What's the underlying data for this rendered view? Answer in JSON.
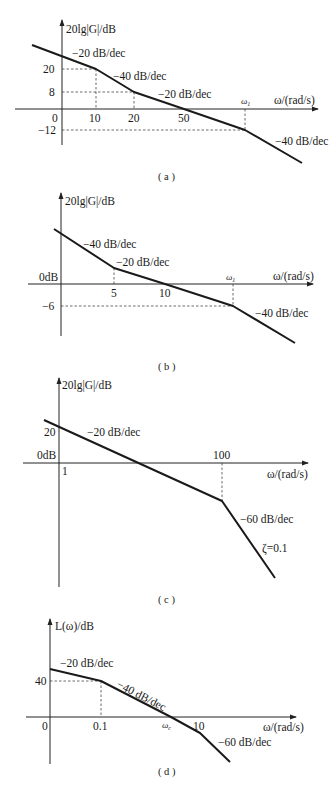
{
  "chart_data": [
    {
      "id": "a",
      "type": "line",
      "title": "Bode asymptotic magnitude plot (a)",
      "caption": "( a )",
      "ylabel": "20lg|G|/dB",
      "xlabel": "ω/(rad/s)",
      "x_scale": "log",
      "y_ticks": [
        "20",
        "8",
        "0",
        "-12"
      ],
      "x_ticks": [
        "10",
        "20",
        "50",
        "ω1"
      ],
      "breakpoints": [
        {
          "omega": "10",
          "db": 20
        },
        {
          "omega": "20",
          "db": 8
        },
        {
          "omega": "50",
          "db": 0
        },
        {
          "omega": "ω1",
          "db": -12
        }
      ],
      "slopes": [
        "-20 dB/dec",
        "-40 dB/dec",
        "-20 dB/dec",
        "-40 dB/dec"
      ],
      "px": {
        "origin": [
          62,
          109
        ],
        "yaxis_top": 20,
        "yaxis_bottom": 145,
        "xaxis_left": 15,
        "xaxis_right": 318,
        "curve": [
          [
            32,
            45
          ],
          [
            96,
            69
          ],
          [
            134,
            92
          ],
          [
            184,
            109
          ],
          [
            245,
            130
          ],
          [
            302,
            163
          ]
        ],
        "guides": [
          {
            "x1": 62,
            "y1": 69,
            "x2": 96,
            "y2": 69
          },
          {
            "x1": 96,
            "y1": 69,
            "x2": 96,
            "y2": 109
          },
          {
            "x1": 62,
            "y1": 92,
            "x2": 134,
            "y2": 92
          },
          {
            "x1": 134,
            "y1": 92,
            "x2": 134,
            "y2": 109
          },
          {
            "x1": 62,
            "y1": 130,
            "x2": 245,
            "y2": 130
          },
          {
            "x1": 245,
            "y1": 109,
            "x2": 245,
            "y2": 130
          }
        ]
      }
    },
    {
      "id": "b",
      "type": "line",
      "title": "Bode asymptotic magnitude plot (b)",
      "caption": "( b )",
      "ylabel": "20lg|G|/dB",
      "xlabel": "ω/(rad/s)",
      "x_scale": "log",
      "y_ticks": [
        "0dB",
        "-6"
      ],
      "x_ticks": [
        "5",
        "10",
        "ω1"
      ],
      "breakpoints": [
        {
          "omega": "5",
          "db": null
        },
        {
          "omega": "10",
          "db": 0
        },
        {
          "omega": "ω1",
          "db": -6
        }
      ],
      "slopes": [
        "-40 dB/dec",
        "-20 dB/dec",
        "-40 dB/dec"
      ],
      "px": {
        "origin": [
          61,
          284
        ],
        "yaxis_top": 193,
        "yaxis_bottom": 336,
        "xaxis_left": 28,
        "xaxis_right": 313,
        "curve": [
          [
            54,
            229
          ],
          [
            114,
            268
          ],
          [
            165,
            284
          ],
          [
            233,
            306
          ],
          [
            295,
            343
          ]
        ],
        "guides": [
          {
            "x1": 114,
            "y1": 268,
            "x2": 114,
            "y2": 284
          },
          {
            "x1": 61,
            "y1": 306,
            "x2": 233,
            "y2": 306
          },
          {
            "x1": 233,
            "y1": 284,
            "x2": 233,
            "y2": 306
          }
        ]
      }
    },
    {
      "id": "c",
      "type": "line",
      "title": "Bode asymptotic magnitude plot (c)",
      "caption": "( c )",
      "ylabel": "20lg|G|/dB",
      "xlabel": "ω/(rad/s)",
      "x_scale": "log",
      "y_ticks": [
        "20",
        "0dB"
      ],
      "x_ticks": [
        "1",
        "100"
      ],
      "breakpoints": [
        {
          "omega": "1",
          "db": 20
        },
        {
          "omega": "10",
          "db": 0
        },
        {
          "omega": "100",
          "db": -20
        }
      ],
      "slopes": [
        "-20 dB/dec",
        "-60 dB/dec"
      ],
      "annotations": [
        "ζ=0.1"
      ],
      "px": {
        "origin": [
          59,
          463
        ],
        "yaxis_top": 378,
        "yaxis_bottom": 587,
        "xaxis_left": 23,
        "xaxis_right": 308,
        "curve": [
          [
            44,
            420
          ],
          [
            222,
            501
          ],
          [
            275,
            578
          ]
        ],
        "guides": [
          {
            "x1": 222,
            "y1": 463,
            "x2": 222,
            "y2": 501
          }
        ]
      }
    },
    {
      "id": "d",
      "type": "line",
      "title": "Bode asymptotic magnitude plot (d)",
      "caption": "( d )",
      "ylabel": "L(ω)/dB",
      "xlabel": "ω/(rad/s)",
      "x_scale": "log",
      "y_ticks": [
        "40",
        "0"
      ],
      "x_ticks": [
        "0.1",
        "ωc",
        "10"
      ],
      "breakpoints": [
        {
          "omega": "0.1",
          "db": 40
        },
        {
          "omega": "ωc",
          "db": 0
        },
        {
          "omega": "10",
          "db": null
        }
      ],
      "slopes": [
        "-20 dB/dec",
        "-40 dB/dec",
        "-60 dB/dec"
      ],
      "px": {
        "origin": [
          50,
          717
        ],
        "yaxis_top": 619,
        "yaxis_bottom": 764,
        "xaxis_left": 26,
        "xaxis_right": 296,
        "curve": [
          [
            50,
            669
          ],
          [
            101,
            681
          ],
          [
            171,
            717
          ],
          [
            200,
            733
          ],
          [
            230,
            762
          ]
        ],
        "guides": [
          {
            "x1": 50,
            "y1": 681,
            "x2": 101,
            "y2": 681
          },
          {
            "x1": 101,
            "y1": 681,
            "x2": 101,
            "y2": 717
          }
        ]
      }
    }
  ],
  "labels": {
    "a": {
      "ylabel": "20lg|G|/dB",
      "xlabel": "ω/(rad/s)",
      "slope1": "−20 dB/dec",
      "slope2": "−40 dB/dec",
      "slope3": "−20 dB/dec",
      "slope4": "−40 dB/dec",
      "y20": "20",
      "y8": "8",
      "y0": "0",
      "ym12": "−12",
      "x10": "10",
      "x20": "20",
      "x50": "50",
      "xw1": "ω",
      "xw1sub": "1",
      "caption": "( a )"
    },
    "b": {
      "ylabel": "20lg|G|/dB",
      "xlabel": "ω/(rad/s)",
      "slope1": "−40 dB/dec",
      "slope2": "−20 dB/dec",
      "slope3": "−40 dB/dec",
      "y0": "0dB",
      "ym6": "−6",
      "x5": "5",
      "x10": "10",
      "xw1": "ω",
      "xw1sub": "1",
      "caption": "( b )"
    },
    "c": {
      "ylabel": "20lg|G|/dB",
      "xlabel": "ω/(rad/s)",
      "slope1": "−20 dB/dec",
      "slope2": "−60 dB/dec",
      "zeta": "ζ=0.1",
      "y20": "20",
      "y0": "0dB",
      "x1": "1",
      "x100": "100",
      "caption": "( c )"
    },
    "d": {
      "ylabel": "L(ω)/dB",
      "xlabel": "ω/(rad/s)",
      "slope1": "−20 dB/dec",
      "slope2": "−40 dB/dec",
      "slope3": "−60 dB/dec",
      "y40": "40",
      "y0": "0",
      "x01": "0.1",
      "xwc": "ω",
      "xwcsub": "c",
      "x10": "10",
      "caption": "( d )"
    }
  }
}
